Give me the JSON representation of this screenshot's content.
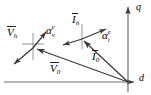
{
  "figure": {
    "type": "vector-phasor-diagram",
    "frame": "dq rotating reference frame",
    "background": "#ffffff",
    "stroke_color": "#3a3a3a",
    "text_color": "#1a1a1a"
  },
  "axes": {
    "horizontal": {
      "label": "d",
      "name": "d-axis"
    },
    "vertical": {
      "label": "q",
      "name": "q-axis"
    },
    "origin": {
      "x": 128,
      "y": 82
    }
  },
  "vectors": {
    "v0": {
      "base": "V",
      "subscript": "0",
      "label": "V̈0",
      "from": {
        "x": 128,
        "y": 82
      },
      "to": {
        "x": 34,
        "y": 48
      },
      "label_pos": {
        "x": 52,
        "y": 66
      }
    },
    "i0": {
      "base": "I",
      "subscript": "0",
      "label": "Ï0",
      "from": {
        "x": 128,
        "y": 82
      },
      "to": {
        "x": 82,
        "y": 39
      },
      "label_pos": {
        "x": 92,
        "y": 54
      }
    },
    "vh": {
      "base": "V",
      "subscript": "h",
      "label": "V̈h",
      "label_pos": {
        "x": 8,
        "y": 28
      },
      "tip": {
        "x": 34,
        "y": 48
      }
    },
    "ih": {
      "base": "I",
      "subscript": "h",
      "label": "Ïh",
      "label_pos": {
        "x": 72,
        "y": 16
      },
      "tip": {
        "x": 82,
        "y": 39
      }
    }
  },
  "angles": {
    "alpha_v": {
      "base": "α",
      "superscript": "e",
      "subscript": "v",
      "label": "αvᵉ",
      "label_pos": {
        "x": 44,
        "y": 26
      }
    },
    "alpha_i": {
      "base": "α",
      "superscript": "e",
      "subscript": "i",
      "label": "αiᵉ",
      "label_pos": {
        "x": 101,
        "y": 31
      }
    }
  }
}
